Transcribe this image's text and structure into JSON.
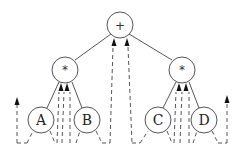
{
  "diagram": {
    "type": "expression-tree-euler-tour",
    "nodes": [
      {
        "id": "root",
        "label": "+",
        "cx": 120,
        "cy": 25
      },
      {
        "id": "mul-left",
        "label": "*",
        "cx": 65,
        "cy": 70
      },
      {
        "id": "mul-right",
        "label": "*",
        "cx": 182,
        "cy": 70
      },
      {
        "id": "A",
        "label": "A",
        "cx": 41,
        "cy": 120
      },
      {
        "id": "B",
        "label": "B",
        "cx": 87,
        "cy": 120
      },
      {
        "id": "C",
        "label": "C",
        "cx": 158,
        "cy": 120
      },
      {
        "id": "D",
        "label": "D",
        "cx": 204,
        "cy": 120
      }
    ],
    "edges": [
      {
        "from": "root",
        "to": "mul-left"
      },
      {
        "from": "root",
        "to": "mul-right"
      },
      {
        "from": "mul-left",
        "to": "A"
      },
      {
        "from": "mul-left",
        "to": "B"
      },
      {
        "from": "mul-right",
        "to": "C"
      },
      {
        "from": "mul-right",
        "to": "D"
      }
    ],
    "colors": {
      "stroke": "#555555",
      "arrow": "#111111",
      "background": "#ffffff"
    }
  }
}
